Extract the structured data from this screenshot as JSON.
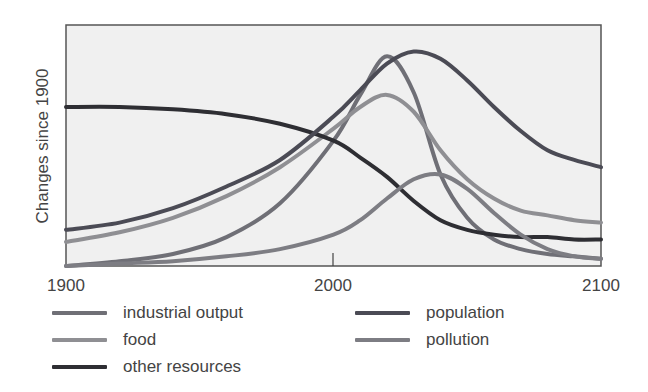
{
  "chart_data": {
    "type": "line",
    "title": "",
    "xlabel": "",
    "ylabel": "Changes since 1900",
    "x_ticks": [
      "1900",
      "2000",
      "2100"
    ],
    "xlim": [
      1900,
      2100
    ],
    "ylim": [
      0,
      1
    ],
    "y_scale_note": "normalized (no y ticks shown); 0 = bottom of plot, 1 = top",
    "grid": false,
    "legend_position": "below",
    "background": "#f0f0f0",
    "x": [
      1900,
      1920,
      1940,
      1960,
      1980,
      2000,
      2010,
      2020,
      2030,
      2040,
      2050,
      2060,
      2070,
      2080,
      2090,
      2100
    ],
    "series": [
      {
        "name": "industrial output",
        "color": "#6f6f76",
        "values": [
          0.0,
          0.02,
          0.05,
          0.12,
          0.26,
          0.52,
          0.71,
          0.87,
          0.72,
          0.38,
          0.2,
          0.11,
          0.07,
          0.05,
          0.04,
          0.03
        ]
      },
      {
        "name": "food",
        "color": "#8f8f93",
        "values": [
          0.1,
          0.14,
          0.2,
          0.29,
          0.41,
          0.57,
          0.66,
          0.71,
          0.64,
          0.48,
          0.36,
          0.28,
          0.23,
          0.21,
          0.19,
          0.18
        ]
      },
      {
        "name": "other resources",
        "color": "#2e2e33",
        "values": [
          0.66,
          0.66,
          0.65,
          0.63,
          0.59,
          0.52,
          0.45,
          0.37,
          0.27,
          0.19,
          0.15,
          0.13,
          0.12,
          0.12,
          0.11,
          0.11
        ]
      },
      {
        "name": "population",
        "color": "#4b4b55",
        "values": [
          0.15,
          0.18,
          0.24,
          0.33,
          0.44,
          0.62,
          0.73,
          0.84,
          0.89,
          0.86,
          0.77,
          0.66,
          0.56,
          0.48,
          0.44,
          0.41
        ]
      },
      {
        "name": "pollution",
        "color": "#7d7d83",
        "values": [
          0.0,
          0.01,
          0.02,
          0.04,
          0.07,
          0.13,
          0.19,
          0.28,
          0.36,
          0.38,
          0.32,
          0.22,
          0.13,
          0.07,
          0.04,
          0.03
        ]
      }
    ]
  },
  "axis": {
    "ylabel": "Changes since 1900",
    "ticks": [
      {
        "label": "1900",
        "x": 66
      },
      {
        "label": "2000",
        "x": 333
      },
      {
        "label": "2100",
        "x": 601
      }
    ]
  },
  "legend": [
    {
      "label": "industrial output",
      "color": "#6f6f76",
      "col": 0,
      "row": 0
    },
    {
      "label": "food",
      "color": "#8f8f93",
      "col": 0,
      "row": 1
    },
    {
      "label": "other resources",
      "color": "#2e2e33",
      "col": 0,
      "row": 2
    },
    {
      "label": "population",
      "color": "#4b4b55",
      "col": 1,
      "row": 0
    },
    {
      "label": "pollution",
      "color": "#7d7d83",
      "col": 1,
      "row": 1
    }
  ]
}
